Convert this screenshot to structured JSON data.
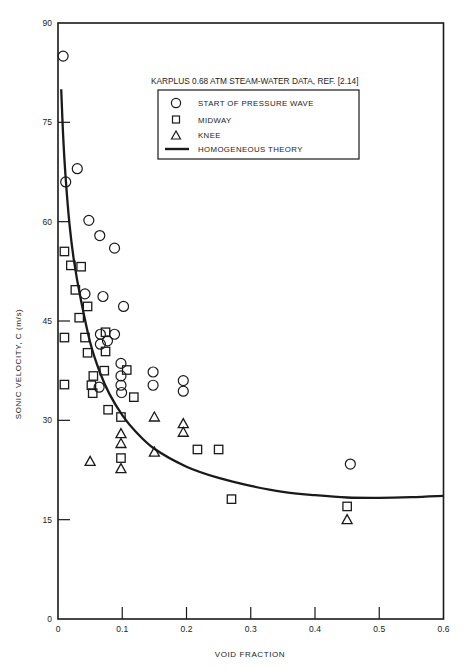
{
  "chart_data": {
    "type": "scatter",
    "title": "KARPLUS 0.68 ATM STEAM-WATER DATA, REF. [2.14]",
    "xlabel": "VOID FRACTION",
    "ylabel": "SONIC VELOCITY, C (m/s)",
    "xlim": [
      0,
      0.6
    ],
    "ylim": [
      0,
      90
    ],
    "xticks": [
      0,
      0.1,
      0.2,
      0.3,
      0.4,
      0.5,
      0.6
    ],
    "xtick_labels": [
      "0",
      "0.1",
      "0.2",
      "0.3",
      "0.4",
      "0.5",
      "0.6"
    ],
    "yticks": [
      0,
      15,
      30,
      45,
      60,
      75,
      90
    ],
    "ytick_labels": [
      "0",
      "15",
      "30",
      "45",
      "60",
      "75",
      "90"
    ],
    "grid": false,
    "legend_position": "upper right (inside)",
    "series": [
      {
        "name": "START OF PRESSURE WAVE",
        "marker": "circle",
        "points": [
          [
            0.008,
            85.0
          ],
          [
            0.012,
            66.0
          ],
          [
            0.03,
            68.0
          ],
          [
            0.048,
            60.2
          ],
          [
            0.065,
            57.9
          ],
          [
            0.088,
            56.0
          ],
          [
            0.042,
            49.1
          ],
          [
            0.07,
            48.7
          ],
          [
            0.102,
            47.2
          ],
          [
            0.066,
            43.0
          ],
          [
            0.088,
            43.0
          ],
          [
            0.066,
            41.5
          ],
          [
            0.077,
            42.0
          ],
          [
            0.098,
            38.6
          ],
          [
            0.098,
            36.7
          ],
          [
            0.098,
            35.3
          ],
          [
            0.099,
            34.2
          ],
          [
            0.064,
            35.0
          ],
          [
            0.148,
            37.3
          ],
          [
            0.148,
            35.3
          ],
          [
            0.195,
            36.0
          ],
          [
            0.195,
            34.4
          ],
          [
            0.455,
            23.4
          ]
        ]
      },
      {
        "name": "MIDWAY",
        "marker": "square",
        "points": [
          [
            0.01,
            55.5
          ],
          [
            0.02,
            53.4
          ],
          [
            0.036,
            53.2
          ],
          [
            0.027,
            49.7
          ],
          [
            0.046,
            47.2
          ],
          [
            0.033,
            45.5
          ],
          [
            0.01,
            42.5
          ],
          [
            0.042,
            42.5
          ],
          [
            0.074,
            43.3
          ],
          [
            0.046,
            40.2
          ],
          [
            0.074,
            40.4
          ],
          [
            0.01,
            35.4
          ],
          [
            0.055,
            36.7
          ],
          [
            0.052,
            35.3
          ],
          [
            0.054,
            34.1
          ],
          [
            0.072,
            37.5
          ],
          [
            0.107,
            37.6
          ],
          [
            0.118,
            33.5
          ],
          [
            0.078,
            31.6
          ],
          [
            0.098,
            30.5
          ],
          [
            0.098,
            24.3
          ],
          [
            0.217,
            25.6
          ],
          [
            0.25,
            25.6
          ],
          [
            0.27,
            18.1
          ],
          [
            0.45,
            17.0
          ]
        ]
      },
      {
        "name": "KNEE",
        "marker": "triangle",
        "points": [
          [
            0.15,
            30.5
          ],
          [
            0.195,
            29.5
          ],
          [
            0.195,
            28.2
          ],
          [
            0.098,
            28.0
          ],
          [
            0.098,
            26.5
          ],
          [
            0.15,
            25.2
          ],
          [
            0.05,
            23.8
          ],
          [
            0.098,
            22.7
          ],
          [
            0.45,
            15.0
          ]
        ]
      },
      {
        "name": "HOMOGENEOUS THEORY",
        "marker": "line",
        "points": [
          [
            0.005,
            80.0
          ],
          [
            0.008,
            73.0
          ],
          [
            0.012,
            66.5
          ],
          [
            0.018,
            59.5
          ],
          [
            0.025,
            54.0
          ],
          [
            0.035,
            48.5
          ],
          [
            0.05,
            41.8
          ],
          [
            0.065,
            37.3
          ],
          [
            0.08,
            34.0
          ],
          [
            0.1,
            30.8
          ],
          [
            0.12,
            28.4
          ],
          [
            0.15,
            25.7
          ],
          [
            0.2,
            23.0
          ],
          [
            0.25,
            21.3
          ],
          [
            0.3,
            20.1
          ],
          [
            0.35,
            19.2
          ],
          [
            0.4,
            18.7
          ],
          [
            0.45,
            18.35
          ],
          [
            0.5,
            18.3
          ],
          [
            0.55,
            18.4
          ],
          [
            0.6,
            18.6
          ]
        ]
      }
    ]
  },
  "legend": {
    "title": "KARPLUS 0.68 ATM STEAM-WATER DATA, REF. [2.14]",
    "items": [
      {
        "symbol": "circle-icon",
        "label": "START OF PRESSURE WAVE"
      },
      {
        "symbol": "square-icon",
        "label": "MIDWAY"
      },
      {
        "symbol": "triangle-icon",
        "label": "KNEE"
      },
      {
        "symbol": "line-icon",
        "label": "HOMOGENEOUS THEORY"
      }
    ]
  },
  "colors": {
    "ink": "#1a1a1a",
    "background": "#ffffff"
  }
}
